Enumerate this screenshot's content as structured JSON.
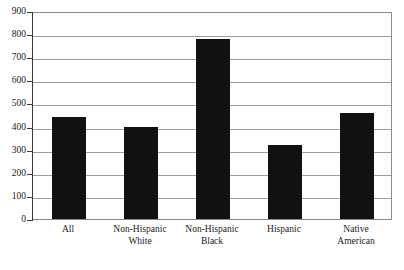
{
  "chart_data": {
    "type": "bar",
    "title": "",
    "subtitle": "",
    "xlabel": "",
    "ylabel": "",
    "categories": [
      "All",
      "Non-Hispanic White",
      "Non-Hispanic Black",
      "Hispanic",
      "Native American"
    ],
    "category_lines": [
      [
        "All",
        ""
      ],
      [
        "Non-Hispanic",
        "White"
      ],
      [
        "Non-Hispanic",
        "Black"
      ],
      [
        "Hispanic",
        ""
      ],
      [
        "Native",
        "American"
      ]
    ],
    "values": [
      440,
      400,
      780,
      320,
      460
    ],
    "ylim": [
      0,
      900
    ],
    "ytick_step": 100,
    "yticks": [
      900,
      800,
      700,
      600,
      500,
      400,
      300,
      200,
      100,
      0
    ],
    "ytick_labels": [
      "900",
      "800",
      "700",
      "600",
      "500",
      "400",
      "300",
      "200",
      "100",
      "0"
    ],
    "grid": true,
    "grid_axis": "y",
    "legend": false,
    "legend_position": "none",
    "bar_color": "#111111",
    "gridline_color": "#9a9a9a",
    "axis_color": "#3a3a3a",
    "plot_border_color": "#8a8a8a",
    "background_color": "#ffffff",
    "annotations": []
  }
}
